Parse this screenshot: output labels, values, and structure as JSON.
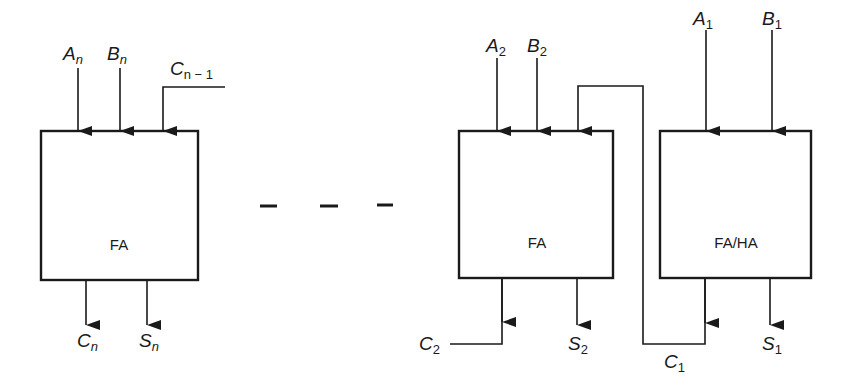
{
  "diagram": {
    "title": "",
    "blocks": [
      {
        "id": "stage-n",
        "label": "FA"
      },
      {
        "id": "stage-2",
        "label": "FA"
      },
      {
        "id": "stage-1",
        "label": "FA/HA"
      }
    ],
    "ellipsis": "— — —",
    "signals": {
      "An": {
        "base": "A",
        "sub": "n"
      },
      "Bn": {
        "base": "B",
        "sub": "n"
      },
      "Cn_1": {
        "base": "C",
        "sub": "n − 1"
      },
      "Cn": {
        "base": "C",
        "sub": "n"
      },
      "Sn": {
        "base": "S",
        "sub": "n"
      },
      "A2": {
        "base": "A",
        "sub": "2"
      },
      "B2": {
        "base": "B",
        "sub": "2"
      },
      "C2": {
        "base": "C",
        "sub": "2"
      },
      "S2": {
        "base": "S",
        "sub": "2"
      },
      "A1": {
        "base": "A",
        "sub": "1"
      },
      "B1": {
        "base": "B",
        "sub": "1"
      },
      "C1": {
        "base": "C",
        "sub": "1"
      },
      "S1": {
        "base": "S",
        "sub": "1"
      }
    },
    "connections": [
      {
        "from": "An",
        "to": "stage-n"
      },
      {
        "from": "Bn",
        "to": "stage-n"
      },
      {
        "from": "Cn_1",
        "to": "stage-n"
      },
      {
        "from": "stage-n",
        "to": "Cn"
      },
      {
        "from": "stage-n",
        "to": "Sn"
      },
      {
        "from": "A2",
        "to": "stage-2"
      },
      {
        "from": "B2",
        "to": "stage-2"
      },
      {
        "from": "C1",
        "to": "stage-2"
      },
      {
        "from": "stage-2",
        "to": "C2"
      },
      {
        "from": "stage-2",
        "to": "S2"
      },
      {
        "from": "A1",
        "to": "stage-1"
      },
      {
        "from": "B1",
        "to": "stage-1"
      },
      {
        "from": "stage-1",
        "to": "C1"
      },
      {
        "from": "stage-1",
        "to": "S1"
      }
    ]
  }
}
